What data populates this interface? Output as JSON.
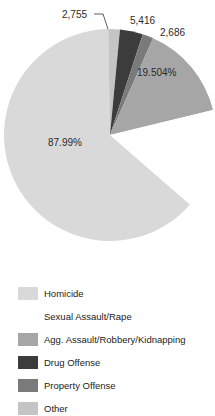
{
  "chart_data": {
    "type": "pie",
    "title": "",
    "center": [
      110,
      135
    ],
    "radius": 106,
    "slices": [
      {
        "name": "Homicide",
        "label": "87.99%",
        "color": "#d9d9d9",
        "start_deg": 131,
        "end_deg": 359
      },
      {
        "name": "Other",
        "label": "2,755",
        "color": "#c4c4c4",
        "start_deg": -1,
        "end_deg": 5.4
      },
      {
        "name": "Drug Offense",
        "label": "5,416",
        "color": "#3c3c3c",
        "start_deg": 5.4,
        "end_deg": 18
      },
      {
        "name": "Property Offense",
        "label": "2,686",
        "color": "#7a7a7a",
        "start_deg": 18,
        "end_deg": 24
      },
      {
        "name": "Agg. Assault/Robbery/Kidnapping",
        "label": "19.504%",
        "color": "#a6a6a6",
        "start_deg": 24,
        "end_deg": 76.4
      },
      {
        "name": "Sexual Assault/Rape",
        "label": "",
        "color": "#ffffff",
        "start_deg": 76.4,
        "end_deg": 131
      }
    ],
    "annotations": [
      {
        "text": "2,755",
        "x": 62,
        "y": 18
      },
      {
        "text": "5,416",
        "x": 130,
        "y": 24
      },
      {
        "text": "2,686",
        "x": 160,
        "y": 36
      },
      {
        "text": "19.504%",
        "x": 137,
        "y": 76
      },
      {
        "text": "87.99%",
        "x": 48,
        "y": 146
      }
    ],
    "legend_position": "bottom"
  },
  "legend": {
    "items": [
      {
        "label": "Homicide",
        "color": "#d9d9d9"
      },
      {
        "label": "Sexual Assault/Rape",
        "color": "#ffffff"
      },
      {
        "label": "Agg. Assault/Robbery/Kidnapping",
        "color": "#a6a6a6"
      },
      {
        "label": "Drug Offense",
        "color": "#3c3c3c"
      },
      {
        "label": "Property Offense",
        "color": "#7a7a7a"
      },
      {
        "label": "Other",
        "color": "#c4c4c4"
      }
    ]
  }
}
